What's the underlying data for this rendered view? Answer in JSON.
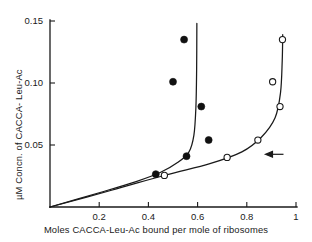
{
  "chart_data": {
    "type": "scatter",
    "title": "",
    "subtitle": "",
    "xlabel": "Moles  CACCA-Leu-Ac bound  per  mole  of  ribosomes",
    "ylabel": "µM  Concn.  of  CACCA- Leu-Ac",
    "xlim": [
      0,
      1
    ],
    "ylim": [
      0,
      0.15
    ],
    "grid": false,
    "legend_position": "none",
    "xticks": [
      {
        "value": 0.2,
        "label": "0.2"
      },
      {
        "value": 0.4,
        "label": "0.4"
      },
      {
        "value": 0.6,
        "label": "0.6"
      },
      {
        "value": 0.8,
        "label": "0.8"
      },
      {
        "value": 1.0,
        "label": "1"
      }
    ],
    "yticks": [
      {
        "value": 0.05,
        "label": "0.05"
      },
      {
        "value": 0.1,
        "label": "0.10"
      },
      {
        "value": 0.15,
        "label": "0.15"
      }
    ],
    "series": [
      {
        "name": "filled-circles",
        "marker": "filled-circle",
        "color": "#111111",
        "points": [
          {
            "x": 0.43,
            "y": 0.0265
          },
          {
            "x": 0.555,
            "y": 0.041
          },
          {
            "x": 0.5,
            "y": 0.101
          },
          {
            "x": 0.545,
            "y": 0.135
          },
          {
            "x": 0.615,
            "y": 0.081
          },
          {
            "x": 0.645,
            "y": 0.054
          }
        ],
        "curve": [
          {
            "x": 0.0,
            "y": 0.0
          },
          {
            "x": 0.2,
            "y": 0.0115
          },
          {
            "x": 0.35,
            "y": 0.0205
          },
          {
            "x": 0.45,
            "y": 0.028
          },
          {
            "x": 0.52,
            "y": 0.036
          },
          {
            "x": 0.565,
            "y": 0.0445
          },
          {
            "x": 0.585,
            "y": 0.058
          },
          {
            "x": 0.593,
            "y": 0.08
          },
          {
            "x": 0.596,
            "y": 0.11
          },
          {
            "x": 0.597,
            "y": 0.148
          }
        ]
      },
      {
        "name": "open-circles",
        "marker": "open-circle",
        "color": "#1a1a1a",
        "points": [
          {
            "x": 0.465,
            "y": 0.0255
          },
          {
            "x": 0.72,
            "y": 0.04
          },
          {
            "x": 0.845,
            "y": 0.054
          },
          {
            "x": 0.935,
            "y": 0.081
          },
          {
            "x": 0.905,
            "y": 0.101
          },
          {
            "x": 0.945,
            "y": 0.135
          }
        ],
        "curve": [
          {
            "x": 0.0,
            "y": 0.0
          },
          {
            "x": 0.25,
            "y": 0.0135
          },
          {
            "x": 0.47,
            "y": 0.0258
          },
          {
            "x": 0.65,
            "y": 0.035
          },
          {
            "x": 0.78,
            "y": 0.0445
          },
          {
            "x": 0.86,
            "y": 0.0565
          },
          {
            "x": 0.915,
            "y": 0.072
          },
          {
            "x": 0.937,
            "y": 0.092
          },
          {
            "x": 0.944,
            "y": 0.118
          },
          {
            "x": 0.946,
            "y": 0.139
          }
        ]
      }
    ],
    "annotations": [
      {
        "type": "arrow",
        "direction": "left",
        "x": 0.88,
        "y": 0.0425,
        "name": "endpoint-arrow"
      }
    ]
  }
}
